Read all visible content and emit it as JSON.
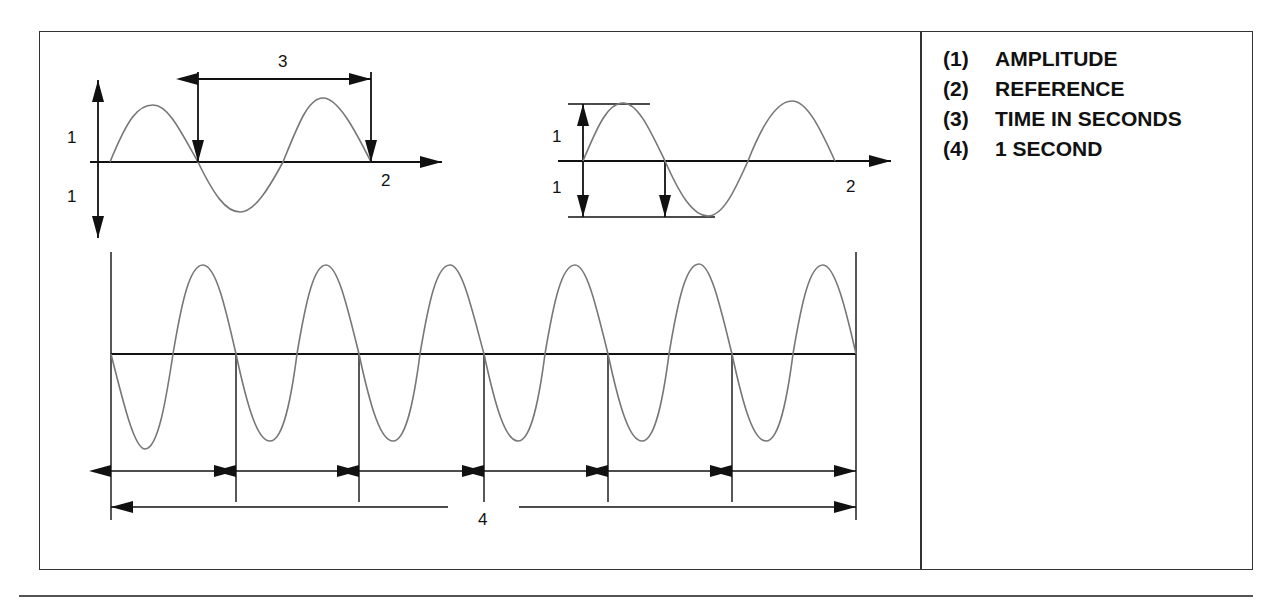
{
  "legend": {
    "items": [
      {
        "num": "(1)",
        "label": "AMPLITUDE"
      },
      {
        "num": "(2)",
        "label": "REFERENCE"
      },
      {
        "num": "(3)",
        "label": "TIME IN SECONDS"
      },
      {
        "num": "(4)",
        "label": "1 SECOND"
      }
    ]
  },
  "diagram": {
    "top_left": {
      "amplitude_up_label": "1",
      "amplitude_down_label": "1",
      "reference_label": "2",
      "period_label": "3"
    },
    "top_right": {
      "amplitude_up_label": "1",
      "amplitude_down_label": "1",
      "reference_label": "2"
    },
    "bottom": {
      "one_second_label": "4",
      "cycles": 6
    }
  },
  "colors": {
    "wave": "#777777",
    "line": "#111111"
  }
}
